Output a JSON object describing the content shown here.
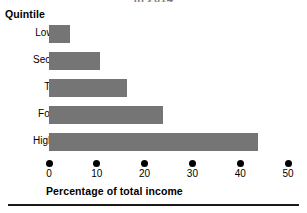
{
  "chart_data": {
    "type": "bar",
    "orientation": "horizontal",
    "title": "in 2014",
    "categories": [
      "Lowest",
      "Second",
      "Third",
      "Fourth",
      "Highest"
    ],
    "values": [
      4.4,
      10.7,
      16.3,
      23.8,
      43.7
    ],
    "xlabel": "Percentage of total income",
    "ylabel": "Quintile",
    "xlim": [
      0,
      50
    ],
    "xticks": [
      0,
      10,
      20,
      30,
      40,
      50
    ],
    "xtick_labels": [
      "0",
      "10",
      "20",
      "30",
      "40",
      "50"
    ],
    "grid": false,
    "legend": null,
    "bar_color": "#757575",
    "tick_marker": "filled-circle"
  },
  "ticks": [
    {
      "label": "0",
      "value": 0
    },
    {
      "label": "10",
      "value": 10
    },
    {
      "label": "20",
      "value": 20
    },
    {
      "label": "30",
      "value": 30
    },
    {
      "label": "40",
      "value": 40
    },
    {
      "label": "50",
      "value": 50
    }
  ],
  "bars": [
    {
      "label": "Lowest",
      "value": 4.4
    },
    {
      "label": "Second",
      "value": 10.7
    },
    {
      "label": "Third",
      "value": 16.3
    },
    {
      "label": "Fourth",
      "value": 23.8
    },
    {
      "label": "Highest",
      "value": 43.7
    }
  ]
}
